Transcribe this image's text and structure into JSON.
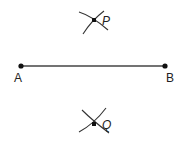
{
  "diagram": {
    "segment": {
      "from": "A",
      "to": "B"
    },
    "points": {
      "A": {
        "label": "A",
        "x": 21,
        "y": 66
      },
      "B": {
        "label": "B",
        "x": 165,
        "y": 66
      },
      "P": {
        "label": "P",
        "x": 94,
        "y": 20
      },
      "Q": {
        "label": "Q",
        "x": 94,
        "y": 124
      }
    },
    "colors": {
      "line": "#333333",
      "point": "#111111"
    }
  }
}
